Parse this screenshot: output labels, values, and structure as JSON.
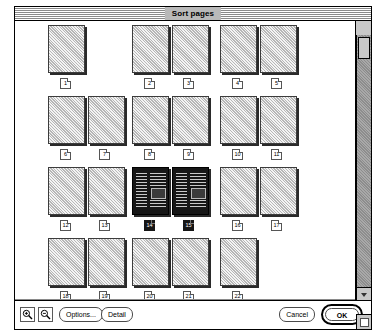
{
  "window": {
    "title": "Sort pages"
  },
  "toolbar": {
    "zoom_in_label": "zoom-in",
    "zoom_out_label": "zoom-out",
    "options_label": "Options...",
    "detail_label": "Detail",
    "cancel_label": "Cancel",
    "ok_label": "OK"
  },
  "scrollbar": {
    "up_arrow": "▲",
    "down_arrow": "▼"
  },
  "pages": {
    "rows": [
      {
        "spreads": [
          {
            "pages": [
              {
                "num": "1",
                "selected": false
              }
            ]
          },
          {
            "pages": [
              {
                "num": "2",
                "selected": false
              },
              {
                "num": "3",
                "selected": false
              }
            ]
          },
          {
            "pages": [
              {
                "num": "4",
                "selected": false
              },
              {
                "num": "5",
                "selected": false
              }
            ]
          }
        ]
      },
      {
        "spreads": [
          {
            "pages": [
              {
                "num": "6",
                "selected": false
              },
              {
                "num": "7",
                "selected": false
              }
            ]
          },
          {
            "pages": [
              {
                "num": "8",
                "selected": false
              },
              {
                "num": "9",
                "selected": false
              }
            ]
          },
          {
            "pages": [
              {
                "num": "10",
                "selected": false
              },
              {
                "num": "11",
                "selected": false
              }
            ]
          }
        ]
      },
      {
        "spreads": [
          {
            "pages": [
              {
                "num": "12",
                "selected": false
              },
              {
                "num": "13",
                "selected": false
              }
            ]
          },
          {
            "pages": [
              {
                "num": "14",
                "selected": true
              },
              {
                "num": "15",
                "selected": true
              }
            ]
          },
          {
            "pages": [
              {
                "num": "16",
                "selected": false
              },
              {
                "num": "17",
                "selected": false
              }
            ]
          }
        ]
      },
      {
        "spreads": [
          {
            "pages": [
              {
                "num": "18",
                "selected": false
              },
              {
                "num": "19",
                "selected": false
              }
            ]
          },
          {
            "pages": [
              {
                "num": "20",
                "selected": false
              },
              {
                "num": "21",
                "selected": false
              }
            ]
          },
          {
            "pages": [
              {
                "num": "22",
                "selected": false
              }
            ]
          }
        ]
      }
    ]
  }
}
